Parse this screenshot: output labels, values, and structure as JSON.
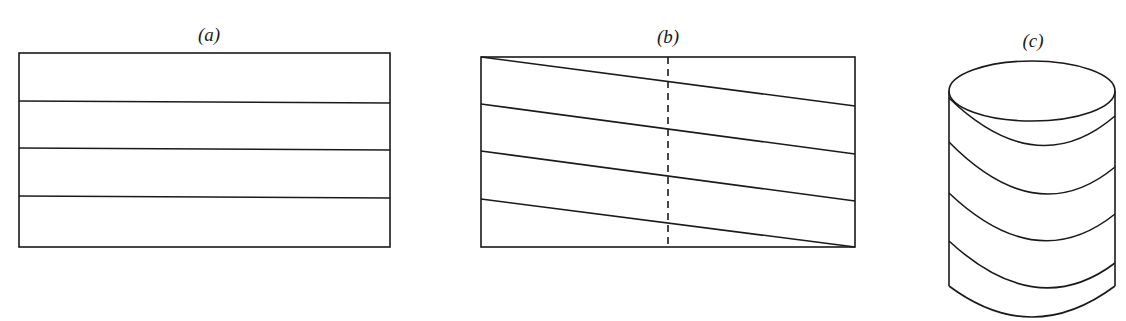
{
  "figure": {
    "panels": [
      {
        "id": "a",
        "label": "(a)",
        "description": "Rectangle divided into four horizontal strips",
        "rect": {
          "x": 19,
          "y": 53,
          "w": 371,
          "h": 194
        },
        "lines": [
          {
            "x1": 19,
            "y1": 101,
            "x2": 390,
            "y2": 103
          },
          {
            "x1": 19,
            "y1": 148,
            "x2": 390,
            "y2": 150
          },
          {
            "x1": 19,
            "y1": 196,
            "x2": 390,
            "y2": 198
          }
        ]
      },
      {
        "id": "b",
        "label": "(b)",
        "description": "Rectangle with four parallel slanted lines and a dashed vertical center line",
        "rect": {
          "x": 481,
          "y": 57,
          "w": 374,
          "h": 190
        },
        "dashed_line": {
          "x1": 668,
          "y1": 57,
          "x2": 668,
          "y2": 247
        },
        "lines": [
          {
            "x1": 481,
            "y1": 57,
            "x2": 855,
            "y2": 106
          },
          {
            "x1": 481,
            "y1": 104,
            "x2": 855,
            "y2": 154
          },
          {
            "x1": 481,
            "y1": 151,
            "x2": 855,
            "y2": 201
          },
          {
            "x1": 481,
            "y1": 199,
            "x2": 855,
            "y2": 247
          }
        ]
      },
      {
        "id": "c",
        "label": "(c)",
        "description": "Cylinder with a helical line wrapped around it",
        "cylinder": {
          "cx": 1032,
          "top_cy": 91,
          "bottom_cy": 286,
          "rx": 83,
          "ry": 30
        },
        "helix_turns": [
          {
            "y_left": 98,
            "y_mid": 145,
            "y_right": 116
          },
          {
            "y_left": 142,
            "y_mid": 193,
            "y_right": 167
          },
          {
            "y_left": 193,
            "y_mid": 240,
            "y_right": 214
          },
          {
            "y_left": 241,
            "y_mid": 287,
            "y_right": 263
          }
        ]
      }
    ]
  }
}
